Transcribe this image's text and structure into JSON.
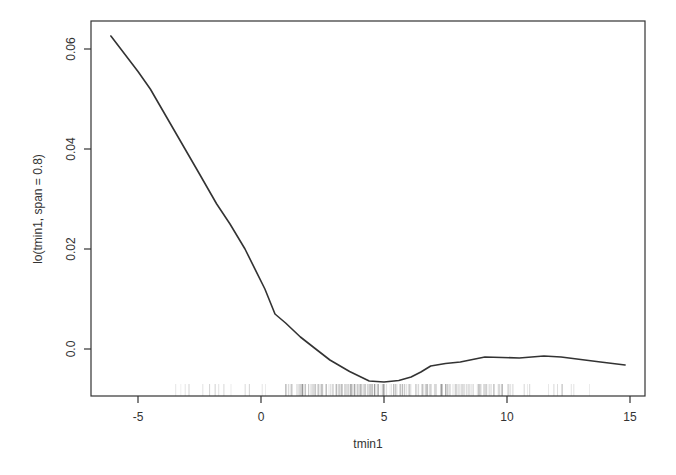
{
  "chart_data": {
    "type": "line",
    "title": "",
    "xlabel": "tmin1",
    "ylabel": "lo(tmin1, span = 0.8)",
    "xlim": [
      -6.9,
      15.6
    ],
    "ylim": [
      -0.0094,
      0.0674
    ],
    "x_ticks": [
      -5,
      0,
      5,
      10,
      15
    ],
    "x_tick_labels": [
      "-5",
      "0",
      "5",
      "10",
      "15"
    ],
    "y_ticks": [
      0.0,
      0.02,
      0.04,
      0.06
    ],
    "y_tick_labels": [
      "0.0",
      "0.02",
      "0.04",
      "0.06"
    ],
    "grid": false,
    "legend": null,
    "series": [
      {
        "name": "lo(tmin1, span = 0.8)",
        "color": "#333333",
        "x": [
          -6.1,
          -5.0,
          -4.5,
          -3.5,
          -2.5,
          -1.8,
          -1.26,
          -0.65,
          0.16,
          0.57,
          1.0,
          1.6,
          2.2,
          2.8,
          3.6,
          4.4,
          5.0,
          5.6,
          6.1,
          6.5,
          6.9,
          7.5,
          8.1,
          8.6,
          9.1,
          9.8,
          10.5,
          11.0,
          11.5,
          12.2,
          13.0,
          13.8,
          14.8
        ],
        "y": [
          0.0626,
          0.0555,
          0.052,
          0.0435,
          0.035,
          0.029,
          0.025,
          0.02,
          0.012,
          0.007,
          0.0052,
          0.0024,
          0.0001,
          -0.0022,
          -0.0045,
          -0.0064,
          -0.0066,
          -0.0063,
          -0.0056,
          -0.0046,
          -0.0034,
          -0.0029,
          -0.0026,
          -0.0021,
          -0.0016,
          -0.0017,
          -0.0018,
          -0.0016,
          -0.0014,
          -0.0016,
          -0.0021,
          -0.0026,
          -0.0032
        ]
      }
    ],
    "rug": {
      "description": "rug plot of tmin1 observations along the bottom axis",
      "x_range": [
        -3.5,
        13.5
      ],
      "densest_range": [
        1,
        10
      ]
    }
  }
}
